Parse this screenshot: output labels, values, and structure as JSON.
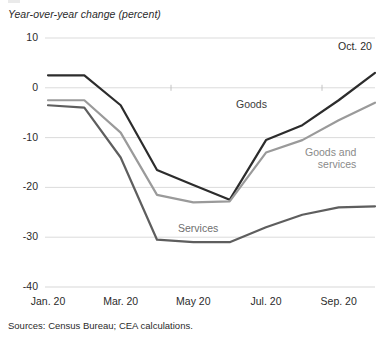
{
  "figure": {
    "axis_title": "Year-over-year change (percent)",
    "source_note": "Sources: Census Bureau; CEA calculations.",
    "end_annotation": "Oct. 20"
  },
  "labels": {
    "goods": "Goods",
    "goods_and_services_line1": "Goods and",
    "goods_and_services_line2": "services",
    "services": "Services"
  },
  "colors": {
    "goods": "#2c2c2c",
    "goods_and_services": "#9a9a9a",
    "services": "#5e5e5e",
    "grid": "#d7d7d7",
    "text": "#2b2b2b"
  },
  "chart_data": {
    "type": "line",
    "title": "",
    "subtitle": "",
    "xlabel": "",
    "ylabel": "Year-over-year change (percent)",
    "ylim": [
      -40,
      10
    ],
    "yticks": [
      10,
      0,
      -10,
      -20,
      -30,
      -40
    ],
    "ytick_labels": [
      "10",
      "0",
      "-10",
      "-20",
      "-30",
      "-40"
    ],
    "x": [
      "Jan. 20",
      "Feb. 20",
      "Mar. 20",
      "Apr. 20",
      "May 20",
      "Jun. 20",
      "Jul. 20",
      "Aug. 20",
      "Sep. 20",
      "Oct. 20"
    ],
    "xticks": [
      "Jan. 20",
      "Mar. 20",
      "May 20",
      "Jul. 20",
      "Sep. 20"
    ],
    "xtick_indices": [
      0,
      2,
      4,
      6,
      8
    ],
    "grid": "horizontal",
    "legend": "inline-annotations",
    "series": [
      {
        "name": "Goods",
        "color": "#2c2c2c",
        "values": [
          2.5,
          2.5,
          -3.5,
          -16.5,
          -19.5,
          -22.5,
          -10.5,
          -7.5,
          -2.5,
          3.0
        ]
      },
      {
        "name": "Goods and services",
        "color": "#9a9a9a",
        "values": [
          -2.5,
          -2.5,
          -9.0,
          -21.5,
          -23.0,
          -22.8,
          -13.0,
          -10.5,
          -6.5,
          -3.0
        ]
      },
      {
        "name": "Services",
        "color": "#5e5e5e",
        "values": [
          -3.5,
          -4.0,
          -14.0,
          -30.5,
          -31.0,
          -31.0,
          -28.0,
          -25.5,
          -24.0,
          -23.8
        ]
      }
    ],
    "annotations": [
      {
        "text": "Oct. 20",
        "x": "Oct. 20",
        "y": 8.5
      },
      {
        "text": "Goods",
        "x": "Jun. 20",
        "y": -5.5
      },
      {
        "text": "Goods and services",
        "x": "Aug. 20",
        "y": -14.5
      },
      {
        "text": "Services",
        "x": "May 20",
        "y": -26.5
      }
    ]
  },
  "geometry": {
    "plot_left": 48,
    "plot_right": 375,
    "plot_top": 38,
    "plot_bottom": 287
  }
}
